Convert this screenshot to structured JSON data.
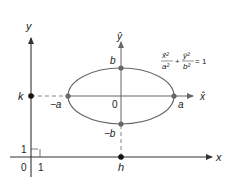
{
  "diagram": {
    "colors": {
      "axis": "#333333",
      "ellipse": "#666666",
      "point_main": "#111111",
      "point_ellipse": "#666666",
      "label": "#222222",
      "equation": "#555555"
    },
    "axes": {
      "x_label": "x",
      "y_label": "y",
      "xhat_label": "x̂",
      "yhat_label": "ŷ",
      "origin_label": "0",
      "unit_x_label": "1",
      "unit_y_label": "1"
    },
    "points": {
      "h_label": "h",
      "k_label": "k",
      "a_label": "a",
      "neg_a_label": "−a",
      "b_label": "b",
      "neg_b_label": "−b",
      "center_label": "0"
    },
    "equation": {
      "term1_num": "x̂²",
      "term1_den": "a²",
      "plus": "+",
      "term2_num": "ŷ²",
      "term2_den": "b²",
      "rhs": "= 1"
    }
  }
}
